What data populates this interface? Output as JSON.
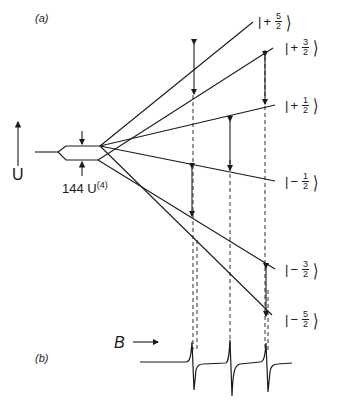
{
  "panels": {
    "a": "(a)",
    "b": "(b)"
  },
  "axis": {
    "energy_label": "U",
    "field_label": "B"
  },
  "splitting_label": {
    "text": "144 U",
    "sup": "(4)"
  },
  "states": [
    {
      "sign": "+",
      "num": "5",
      "den": "2"
    },
    {
      "sign": "+",
      "num": "3",
      "den": "2"
    },
    {
      "sign": "+",
      "num": "1",
      "den": "2"
    },
    {
      "sign": "−",
      "num": "1",
      "den": "2"
    },
    {
      "sign": "−",
      "num": "3",
      "den": "2"
    },
    {
      "sign": "−",
      "num": "5",
      "den": "2"
    }
  ],
  "colors": {
    "ink": "#1a1a1a",
    "background": "#ffffff"
  }
}
